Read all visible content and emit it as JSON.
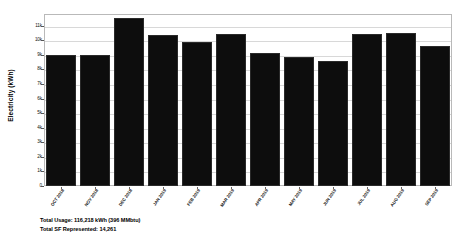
{
  "chart_data": {
    "type": "bar",
    "title": "",
    "xlabel": "",
    "ylabel": "Electricity (kWh)",
    "ylim": [
      0,
      11800
    ],
    "grid": true,
    "legend": "none",
    "categories": [
      "OCT 2018",
      "NOV 2018",
      "DEC 2018",
      "JAN 2019",
      "FEB 2019",
      "MAR 2019",
      "APR 2019",
      "MAY 2019",
      "JUN 2019",
      "JUL 2019",
      "AUG 2019",
      "SEP 2019"
    ],
    "values": [
      9000,
      9000,
      11550,
      10350,
      9850,
      10400,
      9150,
      8850,
      8600,
      10450,
      10500,
      9600
    ],
    "ytick_labels": [
      "11k",
      "10k",
      "9k",
      "8k",
      "7k",
      "6k",
      "5k",
      "4k",
      "3k",
      "2k",
      "1k",
      "0"
    ],
    "ytick_values": [
      11000,
      10000,
      9000,
      8000,
      7000,
      6000,
      5000,
      4000,
      3000,
      2000,
      1000,
      0
    ],
    "bar_color": "#0d0d0d",
    "grid_color": "#d8d8d8",
    "frame_color": "#b9b9b9"
  },
  "footer": {
    "line1": "Total Usage: 116,218 kWh (396 MMbtu)",
    "line2": "Total SF Represented: 14,261"
  }
}
